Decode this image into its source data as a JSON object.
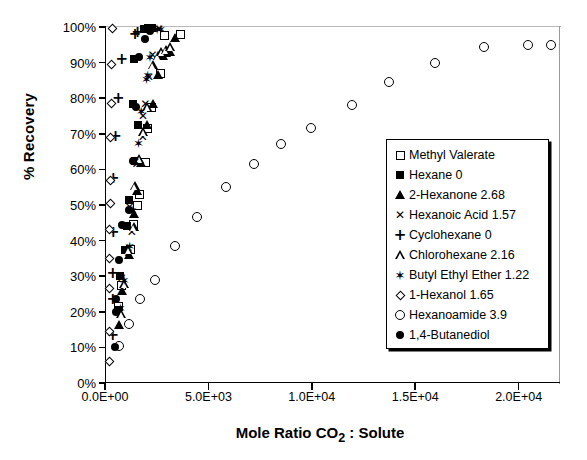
{
  "chart_data": {
    "type": "scatter",
    "title": "",
    "xlabel": "Mole Ratio CO2 : Solute",
    "xlabel_parts": {
      "pre": "Mole Ratio CO",
      "sub": "2",
      "post": " : Solute"
    },
    "ylabel": "% Recovery",
    "xlim": [
      0,
      22000
    ],
    "ylim": [
      0,
      100
    ],
    "xticks": [
      0,
      5000,
      10000,
      15000,
      20000
    ],
    "xtick_labels": [
      "0.0E+00",
      "5.0E+03",
      "1.0E+04",
      "1.5E+04",
      "2.0E+04"
    ],
    "yticks": [
      0,
      10,
      20,
      30,
      40,
      50,
      60,
      70,
      80,
      90,
      100
    ],
    "ytick_labels": [
      "0%",
      "10%",
      "20%",
      "30%",
      "40%",
      "50%",
      "60%",
      "70%",
      "80%",
      "90%",
      "100%"
    ],
    "grid": false,
    "legend_position": "right-inside",
    "series": [
      {
        "name": "Methyl Valerate",
        "value": "",
        "label": "Methyl Valerate",
        "marker": "square-open",
        "points": [
          [
            620,
            21.5
          ],
          [
            740,
            27.5
          ],
          [
            1180,
            37.5
          ],
          [
            1320,
            44.5
          ],
          [
            1540,
            50.0
          ],
          [
            1600,
            53.0
          ],
          [
            1900,
            62.0
          ],
          [
            1990,
            71.5
          ],
          [
            2180,
            77.5
          ],
          [
            2640,
            87.0
          ],
          [
            2840,
            97.5
          ],
          [
            3600,
            97.8
          ]
        ]
      },
      {
        "name": "Hexane 0",
        "value": "0",
        "label": "Hexane  0",
        "marker": "square-filled",
        "points": [
          [
            560,
            20.5
          ],
          [
            700,
            30.0
          ],
          [
            900,
            37.5
          ],
          [
            1020,
            44.0
          ],
          [
            1120,
            51.5
          ],
          [
            1380,
            62.5
          ],
          [
            1550,
            72.5
          ],
          [
            1300,
            78.5
          ],
          [
            1340,
            91.0
          ],
          [
            1820,
            99.5
          ],
          [
            2050,
            99.8
          ],
          [
            2220,
            99.8
          ]
        ]
      },
      {
        "name": "2-Hexanone 2.68",
        "value": "2.68",
        "label": "2-Hexanone  2.68",
        "marker": "triangle-filled",
        "points": [
          [
            620,
            16.5
          ],
          [
            780,
            26.0
          ],
          [
            1130,
            36.0
          ],
          [
            1360,
            47.5
          ],
          [
            1500,
            54.0
          ],
          [
            1700,
            62.0
          ],
          [
            1980,
            72.5
          ],
          [
            2270,
            78.5
          ],
          [
            2540,
            86.5
          ],
          [
            2760,
            92.0
          ],
          [
            2930,
            92.8
          ],
          [
            3120,
            93.0
          ],
          [
            3360,
            97.0
          ]
        ]
      },
      {
        "name": "Hexanoic Acid 1.57",
        "value": "1.57",
        "label": "Hexanoic Acid  1.57",
        "marker": "x-cross",
        "points": [
          [
            600,
            20.0
          ],
          [
            760,
            29.5
          ],
          [
            1080,
            36.5
          ],
          [
            1250,
            42.5
          ],
          [
            1140,
            49.5
          ],
          [
            1480,
            61.5
          ],
          [
            1780,
            69.0
          ],
          [
            1790,
            75.0
          ],
          [
            1900,
            78.5
          ],
          [
            2080,
            86.0
          ],
          [
            2250,
            92.0
          ],
          [
            2560,
            99.5
          ]
        ]
      },
      {
        "name": "Cyclohexane 0",
        "value": "0",
        "label": "Cyclohexane  0",
        "marker": "plus",
        "points": [
          [
            330,
            13.5
          ],
          [
            330,
            23.5
          ],
          [
            330,
            31.0
          ],
          [
            350,
            42.5
          ],
          [
            350,
            57.5
          ],
          [
            460,
            69.5
          ],
          [
            600,
            80.0
          ],
          [
            760,
            91.0
          ],
          [
            1400,
            98.0
          ],
          [
            1520,
            98.5
          ]
        ]
      },
      {
        "name": "Chlorohexane 2.16",
        "value": "2.16",
        "label": "Chlorohexane 2.16",
        "marker": "triangle-open",
        "points": [
          [
            740,
            19.5
          ],
          [
            900,
            28.0
          ],
          [
            1080,
            37.5
          ],
          [
            1350,
            44.0
          ],
          [
            1390,
            55.5
          ],
          [
            1610,
            63.0
          ],
          [
            1820,
            70.5
          ],
          [
            1990,
            77.5
          ],
          [
            2260,
            89.5
          ],
          [
            2500,
            92.0
          ],
          [
            2680,
            93.0
          ],
          [
            2900,
            93.5
          ],
          [
            3100,
            94.5
          ]
        ]
      },
      {
        "name": "Butyl Ethyl Ether 1.22",
        "value": "1.22",
        "label": "Butyl Ethyl Ether  1.22",
        "marker": "star",
        "points": [
          [
            700,
            21.0
          ],
          [
            880,
            29.0
          ],
          [
            1150,
            38.5
          ],
          [
            1270,
            48.5
          ],
          [
            1400,
            62.5
          ],
          [
            1570,
            67.5
          ],
          [
            1700,
            76.5
          ],
          [
            1960,
            85.5
          ],
          [
            2020,
            86.5
          ],
          [
            2120,
            91.5
          ],
          [
            2480,
            99.3
          ],
          [
            2640,
            99.5
          ]
        ]
      },
      {
        "name": "1-Hexanol 1.65",
        "value": "1.65",
        "label": "1-Hexanol  1.65",
        "marker": "diamond-open",
        "points": [
          [
            150,
            6.0
          ],
          [
            160,
            14.5
          ],
          [
            170,
            26.5
          ],
          [
            180,
            35.0
          ],
          [
            190,
            43.0
          ],
          [
            200,
            50.5
          ],
          [
            210,
            57.0
          ],
          [
            230,
            69.0
          ],
          [
            250,
            78.5
          ],
          [
            280,
            89.5
          ],
          [
            330,
            99.5
          ]
        ]
      },
      {
        "name": "Hexanoamide 3.9",
        "value": "3.9",
        "label": "Hexanoamide  3.9",
        "marker": "circle-open",
        "points": [
          [
            640,
            10.5
          ],
          [
            1120,
            16.5
          ],
          [
            1650,
            23.5
          ],
          [
            2380,
            29.0
          ],
          [
            3320,
            38.5
          ],
          [
            4400,
            46.5
          ],
          [
            5800,
            55.0
          ],
          [
            7150,
            61.5
          ],
          [
            8450,
            67.0
          ],
          [
            9900,
            71.5
          ],
          [
            11900,
            78.0
          ],
          [
            13700,
            84.5
          ],
          [
            15900,
            90.0
          ],
          [
            18300,
            94.5
          ],
          [
            20400,
            95.0
          ],
          [
            21500,
            95.0
          ]
        ]
      },
      {
        "name": "1,4-Butanediol",
        "value": "",
        "label": "1,4-Butanediol",
        "marker": "circle-filled",
        "points": [
          [
            420,
            10.0
          ],
          [
            460,
            20.0
          ],
          [
            480,
            23.5
          ],
          [
            620,
            34.5
          ],
          [
            780,
            44.5
          ],
          [
            1120,
            48.5
          ],
          [
            1300,
            62.5
          ],
          [
            1450,
            77.5
          ],
          [
            1600,
            91.5
          ],
          [
            1880,
            96.5
          ],
          [
            2130,
            99.0
          ]
        ]
      }
    ]
  },
  "legend": {
    "rows": [
      {
        "sym": "square-open",
        "text": "Methyl Valerate"
      },
      {
        "sym": "square-filled",
        "text": "Hexane  0"
      },
      {
        "sym": "triangle-filled",
        "text": "2-Hexanone  2.68"
      },
      {
        "sym": "x-cross",
        "text": "Hexanoic Acid  1.57"
      },
      {
        "sym": "plus",
        "text": "Cyclohexane  0"
      },
      {
        "sym": "triangle-open",
        "text": "Chlorohexane 2.16"
      },
      {
        "sym": "star",
        "text": "Butyl Ethyl Ether  1.22"
      },
      {
        "sym": "diamond-open",
        "text": "1-Hexanol  1.65"
      },
      {
        "sym": "circle-open",
        "text": "Hexanoamide  3.9"
      },
      {
        "sym": "circle-filled",
        "text": "1,4-Butanediol"
      }
    ]
  },
  "colors": {
    "marker": "#000000",
    "axis": "#000000",
    "background": "#ffffff"
  }
}
